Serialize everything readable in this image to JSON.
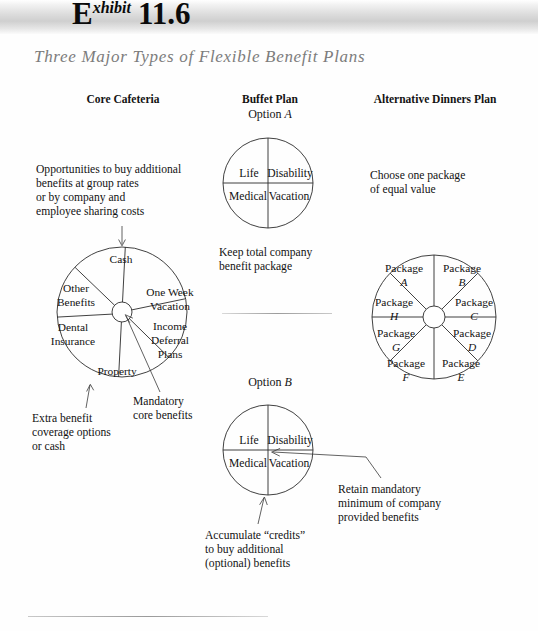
{
  "header": {
    "exhibit_word_cap": "E",
    "exhibit_word_rest": "xhibit",
    "exhibit_number": "11.6",
    "subtitle": "Three Major Types of Flexible Benefit Plans"
  },
  "columns": {
    "core": {
      "heading": "Core Cafeteria"
    },
    "buffet": {
      "heading": "Buffet Plan",
      "option_a_prefix": "Option ",
      "option_a_letter": "A",
      "option_b_prefix": "Option ",
      "option_b_letter": "B"
    },
    "alternative": {
      "heading": "Alternative Dinners Plan"
    }
  },
  "notes": {
    "opportunities": "Opportunities to buy additional\nbenefits at group rates\nor by company and\nemployee sharing costs",
    "extra_benefit": "Extra benefit\ncoverage options\nor cash",
    "mandatory_core": "Mandatory\ncore benefits",
    "keep_total": "Keep total company\nbenefit package",
    "accumulate": "Accumulate “credits”\nto buy additional\n(optional) benefits",
    "choose_package": "Choose one package\nof equal value",
    "retain_minimum": "Retain mandatory\nminimum of company\nprovided benefits"
  },
  "core_wheel": {
    "segments": [
      {
        "id": "cash",
        "line1": "Cash",
        "line2": ""
      },
      {
        "id": "one-week-vacation",
        "line1": "One Week",
        "line2": "Vacation"
      },
      {
        "id": "income-deferral",
        "line1": "Income",
        "line2": "Deferral",
        "line3": "Plans"
      },
      {
        "id": "property",
        "line1": "Property",
        "line2": ""
      },
      {
        "id": "dental-insurance",
        "line1": "Dental",
        "line2": "Insurance"
      },
      {
        "id": "other-benefits",
        "line1": "Other",
        "line2": "Benefits"
      }
    ]
  },
  "buffet_quadrants": {
    "option_a": [
      {
        "id": "life",
        "label": "Life"
      },
      {
        "id": "disability",
        "label": "Disability"
      },
      {
        "id": "medical",
        "label": "Medical"
      },
      {
        "id": "vacation",
        "label": "Vacation"
      }
    ],
    "option_b": [
      {
        "id": "life",
        "label": "Life"
      },
      {
        "id": "disability",
        "label": "Disability"
      },
      {
        "id": "medical",
        "label": "Medical"
      },
      {
        "id": "vacation",
        "label": "Vacation"
      }
    ]
  },
  "alternative_wheel": {
    "word": "Package",
    "segments": [
      {
        "id": "package-a",
        "letter": "A"
      },
      {
        "id": "package-b",
        "letter": "B"
      },
      {
        "id": "package-c",
        "letter": "C"
      },
      {
        "id": "package-d",
        "letter": "D"
      },
      {
        "id": "package-e",
        "letter": "E"
      },
      {
        "id": "package-f",
        "letter": "F"
      },
      {
        "id": "package-g",
        "letter": "G"
      },
      {
        "id": "package-h",
        "letter": "H"
      }
    ]
  },
  "colors": {
    "ink": "#121212",
    "subtitle_gray": "#7c7c7c",
    "rule_gray": "#b9b9b9",
    "band_gray": "#cfcfcf"
  }
}
